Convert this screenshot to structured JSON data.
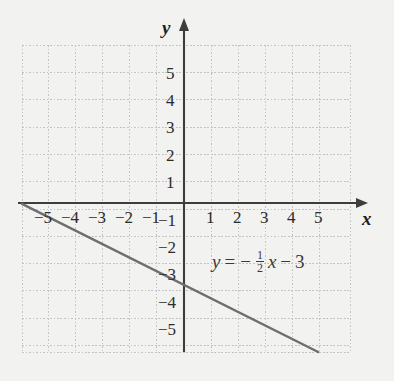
{
  "chart_data": {
    "type": "line",
    "title": "",
    "xlabel": "x",
    "ylabel": "y",
    "xlim": [
      -6,
      6
    ],
    "ylim": [
      -6,
      6
    ],
    "grid": true,
    "grid_step": 1,
    "legend": "none",
    "annotation": "y = -1/2 x - 3",
    "series": [
      {
        "name": "y = -1/2 x - 3",
        "slope": -0.5,
        "intercept": -3,
        "x": [
          -6,
          6
        ],
        "values": [
          0,
          -6
        ],
        "color": "#6e6e6e"
      }
    ],
    "x_tick_labels": [
      "−5",
      "−4",
      "−3",
      "−2",
      "−1",
      "1",
      "2",
      "3",
      "4",
      "5"
    ],
    "x_tick_values": [
      -5,
      -4,
      -3,
      -2,
      -1,
      1,
      2,
      3,
      4,
      5
    ],
    "y_tick_labels": [
      "5",
      "4",
      "3",
      "2",
      "1",
      "−1",
      "−2",
      "−3",
      "−4",
      "−5"
    ],
    "y_tick_values": [
      5,
      4,
      3,
      2,
      1,
      -1,
      -2,
      -3,
      -4,
      -5
    ]
  },
  "axes": {
    "x_name": "x",
    "y_name": "y"
  },
  "equation": {
    "lhs": "y",
    "equals": "=",
    "minus_slope": "−",
    "frac_num": "1",
    "frac_den": "2",
    "var": "x",
    "minus_const": "−",
    "constant": "3"
  },
  "colors": {
    "background": "#f2f2f0",
    "grid": "#c9c9c9",
    "axis": "#3d3d3d",
    "line": "#6e6e6e",
    "text": "#2b2b2b"
  }
}
